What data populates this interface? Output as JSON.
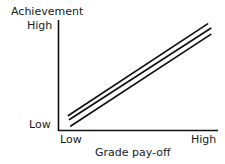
{
  "chart_data": {
    "type": "line",
    "title": "",
    "xlabel": "Grade pay-off",
    "ylabel": "Achievement",
    "xticklabels": [
      "Low",
      "High"
    ],
    "yticklabels": [
      "Low",
      "High"
    ],
    "xlim": [
      0,
      1
    ],
    "ylim": [
      0,
      1
    ],
    "grid": false,
    "legend": "none",
    "line_color": "#111111",
    "axis_color": "#111111",
    "background": "#ffffff",
    "series": [
      {
        "name": "line-top",
        "x": [
          0.065,
          0.935
        ],
        "y": [
          0.135,
          0.965
        ]
      },
      {
        "name": "line-middle",
        "x": [
          0.072,
          0.955
        ],
        "y": [
          0.1,
          0.925
        ]
      },
      {
        "name": "line-bottom",
        "x": [
          0.08,
          0.955
        ],
        "y": [
          0.04,
          0.87
        ]
      }
    ],
    "annotations": []
  },
  "labels": {
    "y_axis_title": "Achievement",
    "y_tick_high": "High",
    "y_tick_low": "Low",
    "x_tick_low": "Low",
    "x_tick_high": "High",
    "x_axis_title": "Grade pay-off"
  }
}
